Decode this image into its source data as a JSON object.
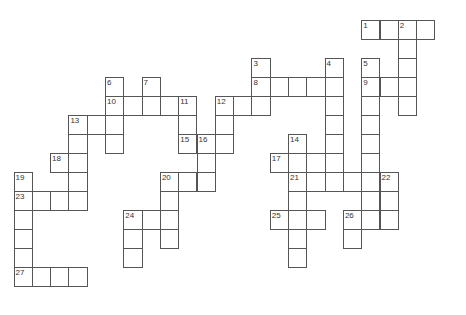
{
  "puzzle": {
    "cell_w": 18.3,
    "cell_h": 19,
    "origin_x": 14,
    "origin_y": 20,
    "entries": [
      {
        "number": "1",
        "dir": "across",
        "col": 19,
        "row": 0,
        "len": 4
      },
      {
        "number": "2",
        "dir": "down",
        "col": 21,
        "row": 0,
        "len": 5
      },
      {
        "number": "3",
        "dir": "down",
        "col": 13,
        "row": 2,
        "len": 3
      },
      {
        "number": "4",
        "dir": "down",
        "col": 17,
        "row": 2,
        "len": 6
      },
      {
        "number": "5",
        "dir": "down",
        "col": 19,
        "row": 2,
        "len": 8
      },
      {
        "number": "6",
        "dir": "down",
        "col": 5,
        "row": 3,
        "len": 4
      },
      {
        "number": "7",
        "dir": "down",
        "col": 7,
        "row": 3,
        "len": 2
      },
      {
        "number": "8",
        "dir": "across",
        "col": 13,
        "row": 3,
        "len": 5
      },
      {
        "number": "9",
        "dir": "across",
        "col": 19,
        "row": 3,
        "len": 3
      },
      {
        "number": "10",
        "dir": "across",
        "col": 5,
        "row": 4,
        "len": 5
      },
      {
        "number": "11",
        "dir": "down",
        "col": 9,
        "row": 4,
        "len": 3
      },
      {
        "number": "12",
        "dir": "across",
        "col": 11,
        "row": 4,
        "len": 3
      },
      {
        "number": "12",
        "dir": "down",
        "col": 11,
        "row": 4,
        "len": 3
      },
      {
        "number": "13",
        "dir": "across",
        "col": 3,
        "row": 5,
        "len": 3
      },
      {
        "number": "13",
        "dir": "down",
        "col": 3,
        "row": 5,
        "len": 5
      },
      {
        "number": "14",
        "dir": "down",
        "col": 15,
        "row": 6,
        "len": 7
      },
      {
        "number": "15",
        "dir": "across",
        "col": 9,
        "row": 6,
        "len": 3
      },
      {
        "number": "16",
        "dir": "down",
        "col": 10,
        "row": 6,
        "len": 3
      },
      {
        "number": "17",
        "dir": "across",
        "col": 14,
        "row": 7,
        "len": 4
      },
      {
        "number": "18",
        "dir": "across",
        "col": 2,
        "row": 7,
        "len": 2
      },
      {
        "number": "19",
        "dir": "down",
        "col": 0,
        "row": 8,
        "len": 6
      },
      {
        "number": "20",
        "dir": "across",
        "col": 8,
        "row": 8,
        "len": 3
      },
      {
        "number": "20",
        "dir": "down",
        "col": 8,
        "row": 8,
        "len": 4
      },
      {
        "number": "21",
        "dir": "across",
        "col": 15,
        "row": 8,
        "len": 6
      },
      {
        "number": "22",
        "dir": "down",
        "col": 20,
        "row": 8,
        "len": 3
      },
      {
        "number": "23",
        "dir": "across",
        "col": 0,
        "row": 9,
        "len": 4
      },
      {
        "number": "24",
        "dir": "across",
        "col": 6,
        "row": 10,
        "len": 3
      },
      {
        "number": "24",
        "dir": "down",
        "col": 6,
        "row": 10,
        "len": 3
      },
      {
        "number": "25",
        "dir": "across",
        "col": 14,
        "row": 10,
        "len": 3
      },
      {
        "number": "26",
        "dir": "across",
        "col": 18,
        "row": 10,
        "len": 3
      },
      {
        "number": "26",
        "dir": "down",
        "col": 18,
        "row": 10,
        "len": 2
      },
      {
        "number": "27",
        "dir": "across",
        "col": 0,
        "row": 13,
        "len": 4
      }
    ]
  }
}
